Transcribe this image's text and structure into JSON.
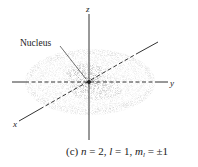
{
  "figure": {
    "panel_label": "(c)",
    "caption": {
      "n_var": "n",
      "n_val": " = 2, ",
      "l_var": "l",
      "l_val": " = 1, ",
      "ml_var": "m",
      "ml_sub": "l",
      "ml_val": " = ±1"
    },
    "annotation": "Nucleus",
    "axes": {
      "x_label": "x",
      "y_label": "y",
      "z_label": "z"
    },
    "colors": {
      "cloud": "#9a9a9a",
      "axes": "#333333",
      "text": "#222222"
    }
  }
}
